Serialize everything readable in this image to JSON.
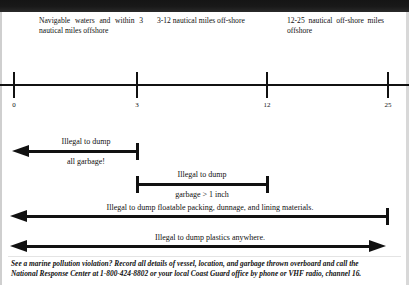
{
  "document": {
    "title": "Garbage discharge restrictions by distance offshore"
  },
  "zones": [
    {
      "id": "zone-0-3",
      "text": "Navigable waters and within 3 nautical miles offshore"
    },
    {
      "id": "zone-3-12",
      "text": "3-12 nautical miles off-shore"
    },
    {
      "id": "zone-12-25",
      "text": "12-25 nautical off-shore miles offshore"
    }
  ],
  "axis": {
    "unit": "nautical miles",
    "ticks": [
      {
        "label": "0",
        "value": 0
      },
      {
        "label": "3",
        "value": 3
      },
      {
        "label": "12",
        "value": 12
      },
      {
        "label": "25",
        "value": 25
      }
    ]
  },
  "rules": [
    {
      "id": "rule-all-garbage",
      "line1": "Illegal to dump",
      "line2": "all garbage!",
      "from": "0-and-beyond-shoreward",
      "to": "3",
      "left_end": "arrow",
      "right_end": "cap"
    },
    {
      "id": "rule-garbage-over-1-inch",
      "line1": "Illegal to dump",
      "line2": "garbage > 1 inch",
      "from": "3",
      "to": "12",
      "left_end": "cap",
      "right_end": "cap"
    },
    {
      "id": "rule-floatable-packing",
      "line1": "Illegal to dump floatable packing, dunnage, and lining materials.",
      "line2": "",
      "from": "shoreward",
      "to": "25",
      "left_end": "arrow",
      "right_end": "cap"
    },
    {
      "id": "rule-plastics",
      "line1": "Illegal to dump plastics anywhere.",
      "line2": "",
      "from": "shoreward",
      "to": "beyond-25",
      "left_end": "arrow",
      "right_end": "arrow"
    }
  ],
  "footer": {
    "line1": "See a marine pollution violation? Record all details of vessel, location, and garbage thrown overboard and call the",
    "line2": "National Response Center at 1-800-424-8802 or your local Coast Guard office by phone or VHF radio, channel 16."
  },
  "colors": {
    "ink": "#111111",
    "paper": "#ffffff",
    "scan_bar": "#151515"
  }
}
